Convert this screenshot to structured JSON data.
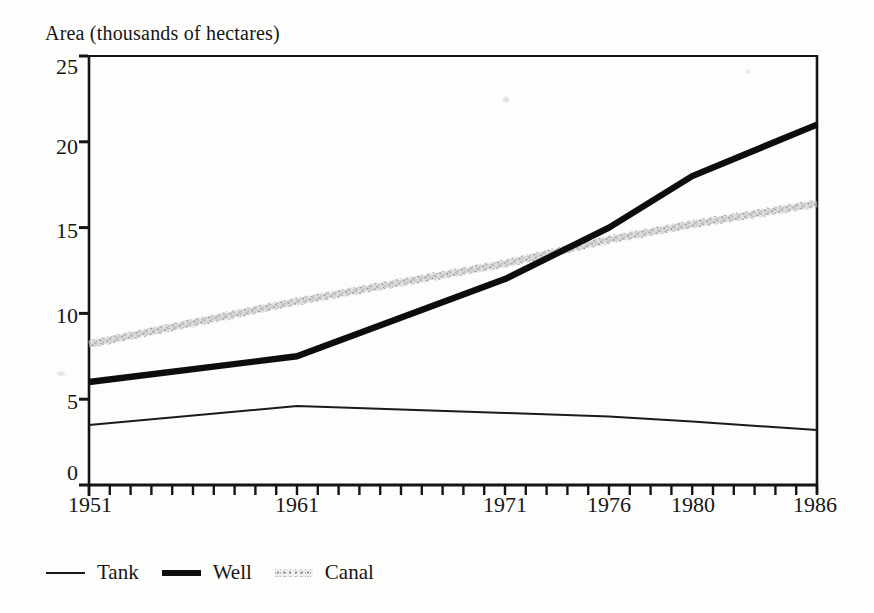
{
  "page": {
    "background": "#fdfdfb",
    "ink_color": "#161616",
    "canal_gray": "#9a9a9a"
  },
  "chart_data": {
    "type": "line",
    "title": "Area (thousands of hectares)",
    "xlabel": "",
    "ylabel": "Area (thousands of hectares)",
    "x_range": [
      1951,
      1986
    ],
    "ylim": [
      0,
      25
    ],
    "y_ticks_top_to_bottom": [
      25,
      20,
      15,
      10,
      5,
      0
    ],
    "x_tick_labels": [
      "1951",
      "1961",
      "1971",
      "1976",
      "1980",
      "1986"
    ],
    "x_label_years": [
      1951,
      1961,
      1971,
      1976,
      1980,
      1986
    ],
    "x_minor_tick_every_years": 1,
    "grid": false,
    "legend_position": "below-chart-left",
    "series": [
      {
        "name": "Tank",
        "line_style": "thin solid black",
        "points": [
          [
            1951,
            3.5
          ],
          [
            1961,
            4.6
          ],
          [
            1971,
            4.2
          ],
          [
            1976,
            4.0
          ],
          [
            1980,
            3.7
          ],
          [
            1986,
            3.2
          ]
        ]
      },
      {
        "name": "Well",
        "line_style": "thick solid black",
        "points": [
          [
            1951,
            6.0
          ],
          [
            1961,
            7.5
          ],
          [
            1971,
            12.0
          ],
          [
            1976,
            15.0
          ],
          [
            1980,
            18.0
          ],
          [
            1986,
            21.0
          ]
        ]
      },
      {
        "name": "Canal",
        "line_style": "stippled gray band",
        "points": [
          [
            1951,
            8.2
          ],
          [
            1961,
            10.7
          ],
          [
            1971,
            12.9
          ],
          [
            1976,
            14.3
          ],
          [
            1980,
            15.2
          ],
          [
            1986,
            16.4
          ]
        ]
      }
    ]
  }
}
